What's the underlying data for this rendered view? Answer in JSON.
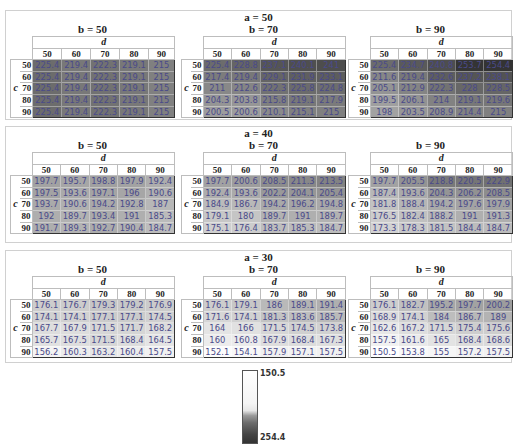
{
  "chart_data": {
    "type": "heatmap",
    "title": "",
    "row_label": "c",
    "col_label": "d",
    "row_ticks": [
      50,
      60,
      70,
      80,
      90
    ],
    "col_ticks": [
      50,
      60,
      70,
      80,
      90
    ],
    "color_scale": {
      "min": 150.5,
      "max": 254.4,
      "low_color": "#ffffff",
      "high_color": "#333333"
    },
    "panels": [
      {
        "title": "a = 50",
        "a": 50,
        "tables": [
          {
            "title": "b = 50",
            "b": 50,
            "values": [
              [
                225.4,
                219.4,
                222.3,
                219.1,
                215
              ],
              [
                225.4,
                219.4,
                222.3,
                219.1,
                215
              ],
              [
                225.4,
                219.4,
                222.3,
                219.1,
                215
              ],
              [
                225.4,
                219.4,
                222.3,
                219.1,
                215
              ],
              [
                225.4,
                219.4,
                222.3,
                219.1,
                215
              ]
            ]
          },
          {
            "title": "b = 70",
            "b": 70,
            "values": [
              [
                225.4,
                228.8,
                237.1,
                240.1,
                241
              ],
              [
                217.4,
                219.4,
                229.1,
                231.9,
                233.1
              ],
              [
                211,
                212.6,
                222.3,
                225.8,
                224.8
              ],
              [
                204.3,
                203.8,
                215.8,
                219.1,
                217.9
              ],
              [
                200.5,
                200.6,
                210.1,
                215.1,
                215
              ]
            ]
          },
          {
            "title": "b = 90",
            "b": 90,
            "values": [
              [
                225.4,
                234.7,
                240.8,
                253.7,
                254.4
              ],
              [
                211.6,
                219.4,
                232.6,
                237.2,
                238.1
              ],
              [
                205.1,
                212.9,
                222.3,
                228,
                228.5
              ],
              [
                199.5,
                206.1,
                214,
                219.1,
                219.6
              ],
              [
                198,
                203.5,
                208.9,
                214.4,
                215
              ]
            ]
          }
        ]
      },
      {
        "title": "a = 40",
        "a": 40,
        "tables": [
          {
            "title": "b = 50",
            "b": 50,
            "values": [
              [
                197.7,
                195.7,
                198.8,
                197.9,
                192.4
              ],
              [
                197.5,
                193.6,
                197.1,
                196,
                190.6
              ],
              [
                193.7,
                190.6,
                194.2,
                192.8,
                187
              ],
              [
                192,
                189.7,
                193.4,
                191,
                185.3
              ],
              [
                191.7,
                189.3,
                192.7,
                190.4,
                184.7
              ]
            ]
          },
          {
            "title": "b = 70",
            "b": 70,
            "values": [
              [
                197.7,
                200.6,
                208.5,
                211.3,
                213.5
              ],
              [
                192.4,
                193.6,
                202.2,
                204.1,
                205.4
              ],
              [
                184.9,
                186.7,
                194.2,
                196.2,
                194.8
              ],
              [
                179.1,
                180,
                189.7,
                191,
                189.7
              ],
              [
                175.1,
                176.4,
                183.7,
                185.3,
                184.7
              ]
            ]
          },
          {
            "title": "b = 90",
            "b": 90,
            "values": [
              [
                197.7,
                205.5,
                218.8,
                220.5,
                222.9
              ],
              [
                187.4,
                193.6,
                204.3,
                206.2,
                208.5
              ],
              [
                181.8,
                188.4,
                194.2,
                197.6,
                197.9
              ],
              [
                176.5,
                182.4,
                188.2,
                191,
                191.3
              ],
              [
                173.3,
                178.3,
                181.5,
                184.4,
                184.7
              ]
            ]
          }
        ]
      },
      {
        "title": "a = 30",
        "a": 30,
        "tables": [
          {
            "title": "b = 50",
            "b": 50,
            "values": [
              [
                176.1,
                176.7,
                179.3,
                179.2,
                176.9
              ],
              [
                174.1,
                174.1,
                177.1,
                177.1,
                174.5
              ],
              [
                167.7,
                167.9,
                171.5,
                171.7,
                168.2
              ],
              [
                165.7,
                167.5,
                171.5,
                168.4,
                164.5
              ],
              [
                156.2,
                160.3,
                163.2,
                160.4,
                157.5
              ]
            ]
          },
          {
            "title": "b = 70",
            "b": 70,
            "values": [
              [
                176.1,
                179.1,
                186,
                189.1,
                191.4
              ],
              [
                171.6,
                174.1,
                181.3,
                183.6,
                185.7
              ],
              [
                164,
                166,
                171.5,
                174.5,
                173.8
              ],
              [
                160,
                160.8,
                167.9,
                168.4,
                167.3
              ],
              [
                152.1,
                154.1,
                157.9,
                157.1,
                157.5
              ]
            ]
          },
          {
            "title": "b = 90",
            "b": 90,
            "values": [
              [
                176.1,
                182.7,
                195.2,
                197.7,
                200.2
              ],
              [
                168.9,
                174.1,
                184,
                186.7,
                189
              ],
              [
                162.6,
                167.2,
                171.5,
                175.4,
                175.6
              ],
              [
                157.5,
                161.6,
                165,
                168.4,
                168.6
              ],
              [
                150.5,
                153.8,
                155,
                157.2,
                157.5
              ]
            ]
          }
        ]
      }
    ],
    "colorbar": {
      "top_label": "150.5",
      "bottom_label": "254.4"
    }
  },
  "labels": {
    "a_var": "a",
    "b_var": "b",
    "c_var": "c",
    "d_var": "d"
  }
}
